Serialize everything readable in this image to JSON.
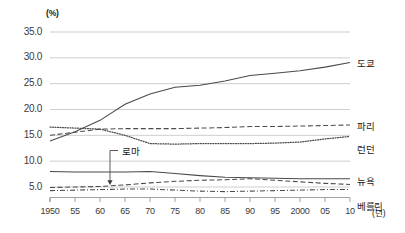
{
  "chart_data": {
    "type": "line",
    "title": "",
    "xlabel": "(년)",
    "ylabel": "(%)",
    "xlim": [
      1950,
      2010
    ],
    "ylim": [
      0,
      35
    ],
    "grid": true,
    "legend_position": "right-inline",
    "x": [
      1950,
      1955,
      1960,
      1965,
      1970,
      1975,
      1980,
      1985,
      1990,
      1995,
      2000,
      2005,
      2010
    ],
    "xtick_labels": [
      "1950",
      "55",
      "60",
      "65",
      "70",
      "75",
      "80",
      "85",
      "90",
      "95",
      "2000",
      "05",
      "10"
    ],
    "ytick_labels": [
      "35.0",
      "30.0",
      "25.0",
      "20.0",
      "15.0",
      "10.0",
      "5.0"
    ],
    "ytick_values": [
      35.0,
      30.0,
      25.0,
      20.0,
      15.0,
      10.0,
      5.0
    ],
    "series": [
      {
        "name": "도쿄",
        "style": "solid",
        "values": [
          13.9,
          15.7,
          17.9,
          21.0,
          23.0,
          24.3,
          24.7,
          25.5,
          26.6,
          27.0,
          27.5,
          28.2,
          29.1
        ]
      },
      {
        "name": "파리",
        "style": "dashed",
        "values": [
          15.0,
          15.6,
          16.2,
          16.3,
          16.3,
          16.3,
          16.4,
          16.5,
          16.7,
          16.7,
          16.8,
          16.9,
          17.0
        ]
      },
      {
        "name": "런던",
        "style": "dotted",
        "values": [
          16.6,
          16.4,
          16.2,
          15.0,
          13.4,
          13.3,
          13.4,
          13.4,
          13.4,
          13.5,
          13.7,
          14.3,
          14.8
        ]
      },
      {
        "name": "뉴욕",
        "style": "solid",
        "values": [
          8.0,
          7.9,
          7.9,
          7.9,
          8.0,
          7.6,
          7.2,
          6.9,
          6.8,
          6.7,
          6.6,
          6.6,
          6.6
        ]
      },
      {
        "name": "로마",
        "style": "dashed",
        "values": [
          4.9,
          5.0,
          5.1,
          5.4,
          5.8,
          6.1,
          6.3,
          6.4,
          6.6,
          6.3,
          6.0,
          5.7,
          5.5
        ]
      },
      {
        "name": "베를린",
        "style": "dashdot",
        "values": [
          4.3,
          4.4,
          4.5,
          4.6,
          4.6,
          4.4,
          4.2,
          4.1,
          4.2,
          4.3,
          4.4,
          4.5,
          4.5
        ]
      }
    ],
    "annotations": [
      {
        "text": "로마",
        "points_to_year": 1962,
        "points_to_value": 5.2
      }
    ]
  }
}
